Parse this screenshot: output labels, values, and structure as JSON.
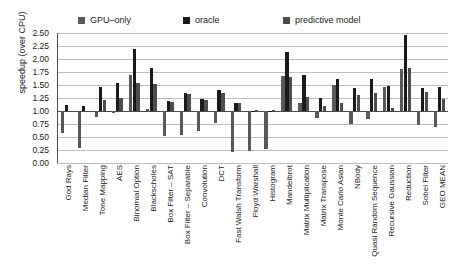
{
  "chart_data": {
    "type": "bar",
    "title": "",
    "xlabel": "",
    "ylabel": "speedup (over CPU)",
    "ylim": [
      0.0,
      2.5
    ],
    "ytick_values": [
      0.0,
      0.25,
      0.5,
      0.75,
      1.0,
      1.25,
      1.5,
      1.75,
      2.0,
      2.25,
      2.5
    ],
    "ytick_labels": [
      "0.00",
      "0.25",
      "0.50",
      "0.75",
      "1.00",
      "1.25",
      "1.50",
      "1.75",
      "2.00",
      "2.25",
      "2.50"
    ],
    "baseline": 1.0,
    "grid": true,
    "legend_position": "top",
    "categories": [
      "God Rays",
      "Median Filter",
      "Tone Mapping",
      "AES",
      "Binomial Option",
      "Blackscholes",
      "Box Filter – SAT",
      "Box Filter – Separable",
      "Convolution",
      "DCT",
      "Fast Walsh Transform",
      "Floyd Warshall",
      "Histogram",
      "Mandelbrot",
      "Matrix Multiplication",
      "Matrix Transpose",
      "Monte Carlo Asian",
      "NBody",
      "Quasi Random Sequence",
      "Recursive Gaussian",
      "Reduction",
      "Sobel Filter",
      "GEO MEAN"
    ],
    "series": [
      {
        "name": "GPU–only",
        "color": "#595959",
        "values": [
          0.57,
          0.29,
          0.88,
          0.96,
          1.7,
          1.03,
          0.51,
          0.54,
          0.62,
          0.76,
          0.21,
          0.24,
          0.26,
          1.68,
          1.15,
          0.86,
          1.5,
          0.75,
          0.85,
          1.47,
          1.81,
          0.73,
          0.7
        ]
      },
      {
        "name": "oracle",
        "color": "#1a1a1a",
        "values": [
          1.11,
          1.1,
          1.46,
          1.54,
          2.2,
          1.82,
          1.19,
          1.35,
          1.23,
          1.4,
          1.16,
          1.0,
          1.0,
          2.13,
          1.69,
          1.25,
          1.61,
          1.45,
          1.62,
          1.48,
          2.47,
          1.44,
          1.46
        ]
      },
      {
        "name": "predictive model",
        "color": "#4d4d4d",
        "values": [
          1.0,
          1.0,
          1.21,
          1.25,
          1.54,
          1.51,
          1.18,
          1.32,
          1.21,
          1.34,
          1.16,
          1.01,
          1.01,
          1.65,
          1.27,
          1.1,
          1.15,
          1.3,
          1.34,
          1.06,
          1.82,
          1.36,
          1.24
        ]
      }
    ]
  },
  "legend": {
    "items": [
      {
        "label": "GPU–only",
        "color": "#595959"
      },
      {
        "label": "oracle",
        "color": "#1a1a1a"
      },
      {
        "label": "predictive model",
        "color": "#4d4d4d"
      }
    ]
  },
  "colors": {
    "gridline": "#bcbcbc",
    "axis": "#4a4a4a",
    "background": "#ffffff",
    "text": "#1a1a1a"
  }
}
